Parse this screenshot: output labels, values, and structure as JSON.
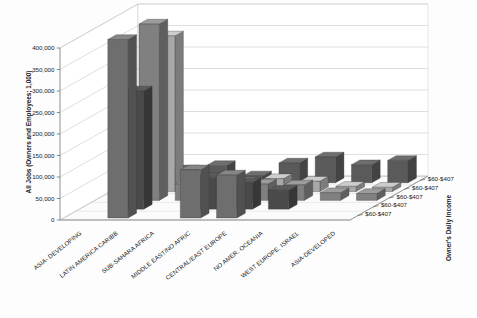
{
  "chart_data": {
    "type": "bar",
    "title": "",
    "subtitle": "",
    "projection": "3d-grouped-bars",
    "xlabel": "",
    "ylabel": "All Jobs (Owners and Employees; 1,000)",
    "zlabel": "Owner's Daily Income",
    "ylim": [
      0,
      400000
    ],
    "yticks": [
      0,
      50000,
      100000,
      150000,
      200000,
      250000,
      300000,
      350000,
      400000
    ],
    "ytick_labels": [
      "0",
      "50,000",
      "100,000",
      "150,000",
      "200,000",
      "250,000",
      "300,000",
      "350,000",
      "400,000"
    ],
    "grid": true,
    "legend_position": "none",
    "categories": [
      "ASIA- DEVELOPING",
      "LATIN AMERICA CARIBB",
      "SUB-SAHARA AFRICA",
      "MIDDLE EAST/NO AFRIC",
      "CENTRAL/EAST EUROPE",
      "NO AMER. OCEANIA",
      "WEST EUROPE, ISRAEL",
      "ASIA-DEVELOPED"
    ],
    "depth_labels": [
      "$60-$407",
      "$60-$407",
      "$60-$407",
      "$60-$407",
      "$60-$407"
    ],
    "series": [
      {
        "name": "$60-$407",
        "depth_index": 0,
        "color": "#6e6e6e",
        "values": [
          0,
          415000,
          0,
          112000,
          100000,
          0,
          0,
          0
        ]
      },
      {
        "name": "$60-$407",
        "depth_index": 1,
        "color": "#4a4a4a",
        "values": [
          0,
          275000,
          0,
          74000,
          62000,
          44000,
          0,
          0
        ]
      },
      {
        "name": "$60-$407",
        "depth_index": 2,
        "color": "#808080",
        "values": [
          0,
          410000,
          38000,
          46000,
          38000,
          36000,
          18000,
          16000
        ]
      },
      {
        "name": "$60-$407",
        "depth_index": 3,
        "color": "#a8a8a8",
        "values": [
          0,
          362000,
          26000,
          22000,
          30000,
          24000,
          12000,
          10000
        ]
      },
      {
        "name": "$60-$407",
        "depth_index": 4,
        "color": "#5a5a5a",
        "values": [
          22000,
          30000,
          40000,
          16000,
          46000,
          60000,
          42000,
          52000
        ]
      }
    ]
  },
  "axes": {
    "y_title": "All Jobs (Owners and Employees; 1,000)",
    "z_title": "Owner's Daily Income"
  },
  "colors": {
    "gridline": "#c9c9c9",
    "axis": "#8d8d8d",
    "background": "#ffffff",
    "bar_light": "#a8a8a8",
    "bar_mid": "#808080",
    "bar_dark": "#4a4a4a"
  }
}
